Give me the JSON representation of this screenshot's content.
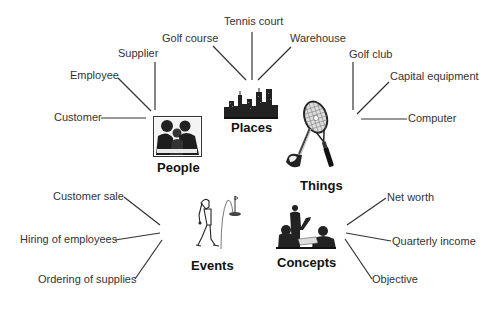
{
  "categories": {
    "people": {
      "label": "People",
      "items": [
        "Customer",
        "Employee",
        "Supplier"
      ]
    },
    "places": {
      "label": "Places",
      "items": [
        "Golf course",
        "Tennis court",
        "Warehouse"
      ]
    },
    "things": {
      "label": "Things",
      "items": [
        "Golf club",
        "Capital equipment",
        "Computer"
      ]
    },
    "events": {
      "label": "Events",
      "items": [
        "Customer sale",
        "Hiring of employees",
        "Ordering of supplies"
      ]
    },
    "concepts": {
      "label": "Concepts",
      "items": [
        "Net worth",
        "Quarterly income",
        "Objective"
      ]
    }
  },
  "icons": {
    "people": "meeting-people-photo-icon",
    "places": "city-skyline-icon",
    "things": "tennis-racket-golf-club-icon",
    "events": "golfer-putting-icon",
    "concepts": "presenter-audience-photo-icon"
  }
}
